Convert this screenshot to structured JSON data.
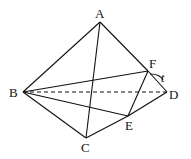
{
  "diagram": {
    "type": "tetrahedron-section",
    "points": {
      "A": {
        "label": "A"
      },
      "B": {
        "label": "B"
      },
      "C": {
        "label": "C"
      },
      "D": {
        "label": "D"
      },
      "E": {
        "label": "E"
      },
      "F": {
        "label": "F"
      }
    },
    "segments": [
      {
        "from": "A",
        "to": "B",
        "style": "solid"
      },
      {
        "from": "A",
        "to": "C",
        "style": "solid"
      },
      {
        "from": "A",
        "to": "F",
        "style": "solid"
      },
      {
        "from": "F",
        "to": "D",
        "style": "solid"
      },
      {
        "from": "B",
        "to": "C",
        "style": "solid"
      },
      {
        "from": "C",
        "to": "E",
        "style": "solid"
      },
      {
        "from": "E",
        "to": "D",
        "style": "solid"
      },
      {
        "from": "B",
        "to": "F",
        "style": "solid"
      },
      {
        "from": "B",
        "to": "E",
        "style": "solid"
      },
      {
        "from": "F",
        "to": "E",
        "style": "solid"
      },
      {
        "from": "B",
        "to": "D",
        "style": "dashed"
      }
    ],
    "annotation": {
      "label": "t",
      "near": "FD"
    }
  }
}
